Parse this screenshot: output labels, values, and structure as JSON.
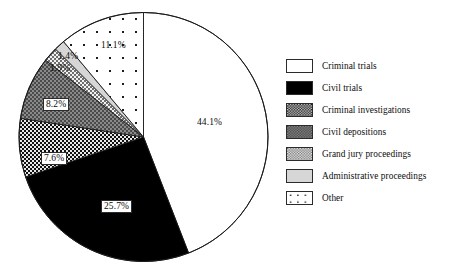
{
  "chart_data": {
    "type": "pie",
    "title": "",
    "subtitle": "",
    "xlabel": "",
    "ylabel": "",
    "grid": false,
    "legend_position": "right",
    "start_angle_deg": 0,
    "direction": "clockwise",
    "categories": [
      "Criminal trials",
      "Civil trials",
      "Criminal investigations",
      "Civil depositions",
      "Grand jury proceedings",
      "Administrative proceedings",
      "Other"
    ],
    "values": [
      44.1,
      25.7,
      7.6,
      8.2,
      1.9,
      1.4,
      11.1
    ],
    "value_labels": [
      "44.1%",
      "25.7%",
      "7.6%",
      "8.2%",
      "1.9%",
      "1.4%",
      "11.1%"
    ],
    "units": "percent",
    "total": 100.0,
    "slices": [
      {
        "label": "Criminal trials",
        "value": 44.1,
        "value_label": "44.1%",
        "fill_style": "solid-white",
        "fill_color": "#ffffff",
        "stroke_color": "#1a1a1a",
        "label_boxed": false
      },
      {
        "label": "Civil trials",
        "value": 25.7,
        "value_label": "25.7%",
        "fill_style": "solid-black",
        "fill_color": "#000000",
        "stroke_color": "#1a1a1a",
        "label_boxed": true
      },
      {
        "label": "Criminal investigations",
        "value": 7.6,
        "value_label": "7.6%",
        "fill_style": "dense-dark-checker",
        "fill_color": "#2a2a2a",
        "stroke_color": "#1a1a1a",
        "label_boxed": true
      },
      {
        "label": "Civil depositions",
        "value": 8.2,
        "value_label": "8.2%",
        "fill_style": "medium-gray-checker",
        "fill_color": "#6e6e6e",
        "stroke_color": "#1a1a1a",
        "label_boxed": true
      },
      {
        "label": "Grand jury proceedings",
        "value": 1.9,
        "value_label": "1.9%",
        "fill_style": "light-checker",
        "fill_color": "#c9c9c9",
        "stroke_color": "#1a1a1a",
        "label_boxed": false
      },
      {
        "label": "Administrative proceedings",
        "value": 1.4,
        "value_label": "1.4%",
        "fill_style": "solid-light-gray",
        "fill_color": "#d2d2d2",
        "stroke_color": "#1a1a1a",
        "label_boxed": false
      },
      {
        "label": "Other",
        "value": 11.1,
        "value_label": "11.1%",
        "fill_style": "sparse-dots",
        "fill_color": "#ffffff",
        "stroke_color": "#1a1a1a",
        "label_boxed": false
      }
    ]
  },
  "legend": {
    "items": [
      {
        "label": "Criminal trials",
        "swatch": "swatch-solid-white"
      },
      {
        "label": "Civil trials",
        "swatch": "swatch-solid-black"
      },
      {
        "label": "Criminal investigations",
        "swatch": "swatch-dense-dark-checker"
      },
      {
        "label": "Civil depositions",
        "swatch": "swatch-medium-gray-checker"
      },
      {
        "label": "Grand jury proceedings",
        "swatch": "swatch-light-checker"
      },
      {
        "label": "Administrative proceedings",
        "swatch": "swatch-solid-light-gray"
      },
      {
        "label": "Other",
        "swatch": "swatch-sparse-dots"
      }
    ]
  },
  "colors": {
    "outline": "#1a1a1a",
    "background": "#ffffff",
    "text": "#0d0d0d"
  }
}
